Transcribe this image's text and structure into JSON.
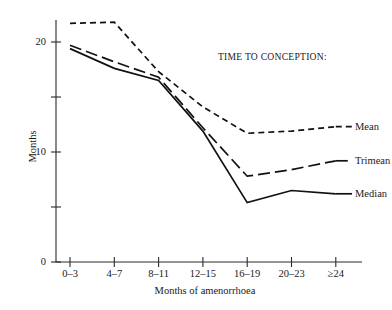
{
  "chart_data": {
    "type": "line",
    "title": "",
    "legend_title": "TIME TO CONCEPTION:",
    "legend_position": "right-of-lines",
    "xlabel": "Months of amenorrhoea",
    "ylabel": "Months",
    "categories": [
      "0–3",
      "4–7",
      "8–11",
      "12–15",
      "16–19",
      "20–23",
      "≥24"
    ],
    "ylim": [
      0,
      22
    ],
    "ytick_values": [
      0,
      5,
      10,
      15,
      20
    ],
    "ytick_labels": [
      "0",
      "",
      "10",
      "",
      "20"
    ],
    "grid": false,
    "series": [
      {
        "name": "Mean",
        "style": "short-dashed",
        "values": [
          21.7,
          21.8,
          17.3,
          14.1,
          11.7,
          11.9,
          12.3
        ]
      },
      {
        "name": "Trimean",
        "style": "long-dashed",
        "values": [
          19.7,
          18.2,
          16.8,
          12.2,
          7.8,
          8.4,
          9.2
        ]
      },
      {
        "name": "Median",
        "style": "solid",
        "values": [
          19.4,
          17.6,
          16.5,
          11.9,
          5.4,
          6.5,
          6.2
        ]
      }
    ]
  },
  "axes": {
    "y_title": "Months",
    "x_title": "Months of amenorrhoea"
  },
  "legend": {
    "title": "TIME TO CONCEPTION:",
    "entries": [
      {
        "label": "Mean"
      },
      {
        "label": "Trimean"
      },
      {
        "label": "Median"
      }
    ]
  }
}
